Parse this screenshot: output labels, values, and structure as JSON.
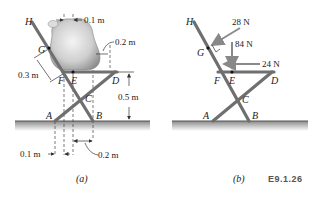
{
  "figure_a": {
    "caption": "(a)",
    "points": {
      "H": "H",
      "G": "G",
      "F": "F",
      "E": "E",
      "D": "D",
      "C": "C",
      "A": "A",
      "B": "B"
    },
    "dimensions": {
      "top_offset": "0.1 m",
      "bag_right_offset": "0.2 m",
      "leg_GF": "0.3 m",
      "seat_height": "0.5 m",
      "bottom_left_offset": "0.1 m",
      "bottom_right_offset": "0.2 m"
    }
  },
  "figure_b": {
    "caption": "(b)",
    "points": {
      "H": "H",
      "G": "G",
      "F": "F",
      "E": "E",
      "D": "D",
      "C": "C",
      "A": "A",
      "B": "B"
    },
    "forces": {
      "normal_at_G": "28 N",
      "weight_at_E": "84 N",
      "horizontal_at_E": "24 N"
    }
  },
  "figure_code": "E9.1.26",
  "colors": {
    "member": "#7a7a7a",
    "member_edge": "#4a4a4a",
    "ground_top": "#8a8a8a",
    "ground_bottom": "#ffffff",
    "bag_light": "#f2f2f2",
    "bag_dark": "#9a9a9a",
    "text": "#222222"
  }
}
